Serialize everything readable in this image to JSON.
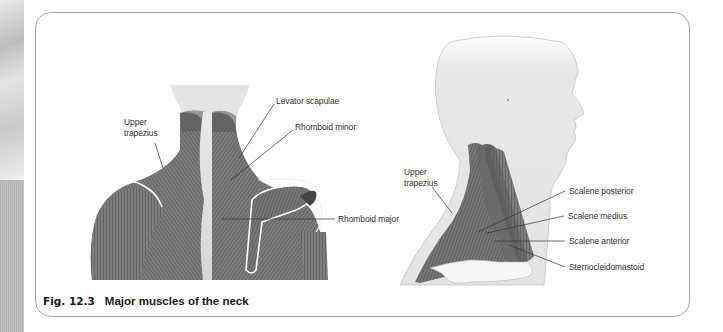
{
  "figure": {
    "number": "Fig. 12.3",
    "title": "Major muscles of the neck"
  },
  "posterior_view": {
    "labels": [
      {
        "id": "upper-trapezius",
        "line1": "Upper",
        "line2": "trapezius"
      },
      {
        "id": "levator-scapulae",
        "text": "Levator scapulae"
      },
      {
        "id": "rhomboid-minor",
        "text": "Rhomboid minor"
      },
      {
        "id": "rhomboid-major",
        "text": "Rhomboid major"
      }
    ]
  },
  "lateral_view": {
    "labels": [
      {
        "id": "upper-trapezius",
        "line1": "Upper",
        "line2": "trapezius"
      },
      {
        "id": "scalene-posterior",
        "text": "Scalene posterior"
      },
      {
        "id": "scalene-medius",
        "text": "Scalene medius"
      },
      {
        "id": "scalene-anterior",
        "text": "Scalene anterior"
      },
      {
        "id": "sternocleidomastoid",
        "text": "Sternocleidomastoid"
      }
    ]
  },
  "colors": {
    "muscle": "#7a7a7a",
    "muscle_dark": "#5e5e5e",
    "skin": "#e6e6e6",
    "frame": "#a8a8a8",
    "leader": "#333333"
  }
}
